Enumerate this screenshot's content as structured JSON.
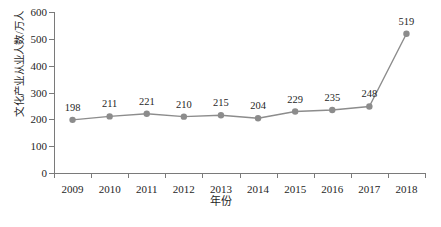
{
  "chart_data": {
    "type": "line",
    "title": "",
    "xlabel": "年份",
    "ylabel": "文化产业从业人数/万人",
    "categories": [
      "2009",
      "2010",
      "2011",
      "2012",
      "2013",
      "2014",
      "2015",
      "2016",
      "2017",
      "2018"
    ],
    "values": [
      198,
      211,
      221,
      210,
      215,
      204,
      229,
      235,
      248,
      519
    ],
    "data_labels": [
      "198",
      "211",
      "221",
      "210",
      "215",
      "204",
      "229",
      "235",
      "248",
      "519"
    ],
    "ylim": [
      0,
      600
    ],
    "yticks": [
      0,
      100,
      200,
      300,
      400,
      500,
      600
    ],
    "ytick_labels": [
      "0",
      "100",
      "200",
      "300",
      "400",
      "500",
      "600"
    ],
    "grid": false,
    "legend": "none",
    "series_color": "#8c8c8c",
    "marker": "circle",
    "marker_color": "#8c8c8c",
    "axis_color": "#7a7a7a",
    "text_color": "#262626",
    "background": "#ffffff"
  }
}
